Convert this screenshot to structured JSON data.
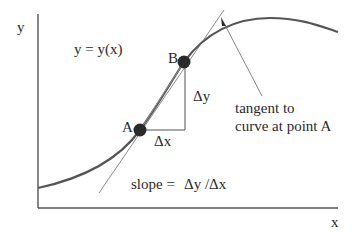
{
  "diagram": {
    "axes": {
      "y_label": "y",
      "x_label": "x"
    },
    "curve_label": "y = y(x)",
    "points": {
      "a_label": "A",
      "b_label": "B"
    },
    "triangle": {
      "dx_label": "Δx",
      "dy_label": "Δy"
    },
    "tangent_annotation": {
      "line1": "tangent to",
      "line2": "curve at point A"
    },
    "slope_formula": {
      "lhs": "slope =",
      "rhs": "Δy /Δx"
    },
    "colors": {
      "curve": "#555555",
      "axes": "#555555",
      "tangent": "#8a8a8a",
      "points": "#2a2a2a",
      "text": "#2a2a2a"
    }
  }
}
